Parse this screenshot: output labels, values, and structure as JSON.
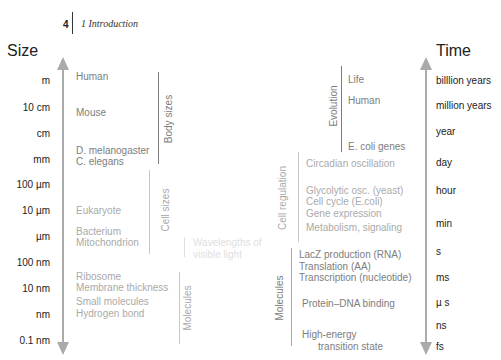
{
  "header": {
    "page_number": "4",
    "chapter_title": "1  Introduction"
  },
  "size_axis": {
    "title": "Size",
    "ticks": [
      "m",
      "10 cm",
      "cm",
      "mm",
      "100  µm",
      "10 µm",
      "µm",
      "100 nm",
      "10 nm",
      "nm",
      "0.1 nm"
    ]
  },
  "time_axis": {
    "title": "Time",
    "ticks": [
      "billlion years",
      "million years",
      "year",
      "day",
      "hour",
      "min",
      "s",
      "ms",
      "µ s",
      "ns",
      "fs"
    ]
  },
  "size_groups": {
    "body_sizes": {
      "label": "Body sizes",
      "items": [
        "Human",
        "Mouse",
        "D. melanogaster",
        "C. elegans"
      ]
    },
    "cell_sizes": {
      "label": "Cell  sizes",
      "items": [
        "Eukaryote",
        "Bacterium",
        "Mitochondrion"
      ]
    },
    "wavelengths": {
      "label_line1": "Wavelengths of",
      "label_line2": "visible light"
    },
    "molecules": {
      "label": "Molecules",
      "items": [
        "Ribosome",
        "Membrane thickness",
        "Small molecules",
        "Hydrogen bond"
      ]
    }
  },
  "time_groups": {
    "evolution": {
      "label": "Evolution",
      "items": [
        "Life",
        "Human",
        "E. coli genes"
      ]
    },
    "cell_regulation": {
      "label": "Cell regulation",
      "items": [
        "Circadian oscillation",
        "Glycolytic osc. (yeast)",
        "Cell cycle (E.coli)",
        "Gene expression",
        "Metabolism, signaling"
      ]
    },
    "molecules": {
      "label": "Molecules",
      "items": [
        "LacZ production (RNA)",
        "Translation (AA)",
        "Transcription (nucleotide)",
        "Protein–DNA binding",
        "High-energy",
        "transition state"
      ]
    }
  },
  "colors": {
    "axis": "#aaaaaa",
    "text_dark": "#222222",
    "group_1": "#7d7d7d",
    "group_2": "#aaaaaa",
    "group_3": "#c8c8c8",
    "group_4": "#e0e0e0"
  }
}
